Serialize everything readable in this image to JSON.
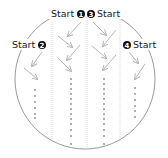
{
  "diagram": {
    "title": "",
    "colors": {
      "circle": "#9a9a9a",
      "divider": "#c8c8c8",
      "arrow": "#b5b5b5",
      "dot": "#888888",
      "text": "#1a1a1a",
      "badge": "#111111"
    },
    "starts": [
      {
        "id": 1,
        "label": "Start",
        "badge": "1",
        "position": "top-center-left"
      },
      {
        "id": 3,
        "label": "Start",
        "badge": "3",
        "position": "top-center-right"
      },
      {
        "id": 2,
        "label": "Start",
        "badge": "2",
        "position": "left"
      },
      {
        "id": 4,
        "label": "Start",
        "badge": "4",
        "position": "right"
      }
    ],
    "lanes": [
      {
        "name": "lane-2",
        "start": 2,
        "arrows": 2,
        "dots": 6
      },
      {
        "name": "lane-1",
        "start": 1,
        "arrows": 4,
        "dots": 13
      },
      {
        "name": "lane-3",
        "start": 3,
        "arrows": 4,
        "dots": 13
      },
      {
        "name": "lane-4",
        "start": 4,
        "arrows": 2,
        "dots": 8
      }
    ]
  }
}
